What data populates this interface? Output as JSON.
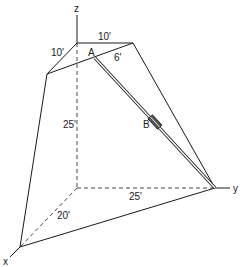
{
  "diagram": {
    "axes": {
      "x_label": "x",
      "y_label": "y",
      "z_label": "z"
    },
    "dimensions": {
      "top_front": "10'",
      "top_left": "10'",
      "a_offset": "6'",
      "height": "25'",
      "y_span": "25'",
      "x_span": "20'"
    },
    "points": {
      "a_label": "A",
      "b_label": "B"
    },
    "colors": {
      "line": "#1a1a1a",
      "background": "#ffffff",
      "collar": "#555555"
    }
  }
}
